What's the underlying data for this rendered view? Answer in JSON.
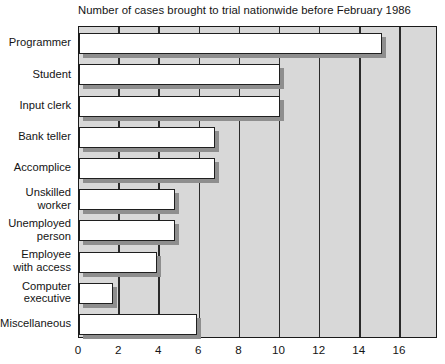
{
  "chart_data": {
    "type": "bar",
    "orientation": "horizontal",
    "title": "Number of cases brought to trial nationwide before February 1986",
    "xlabel": "",
    "ylabel": "",
    "xlim": [
      0,
      17.9
    ],
    "xticks": [
      0,
      2,
      4,
      6,
      8,
      10,
      12,
      14,
      16
    ],
    "xtick_labels": [
      "0",
      "2",
      "4",
      "6",
      "8",
      "10",
      "12",
      "14",
      "16"
    ],
    "grid": "vertical",
    "legend": "none",
    "categories": [
      "Programmer",
      "Student",
      "Input clerk",
      "Bank teller",
      "Accomplice",
      "Unskilled\nworker",
      "Unemployed\nperson",
      "Employee\nwith access",
      "Computer\nexecutive",
      "Miscellaneous"
    ],
    "values": [
      15.1,
      10.0,
      10.0,
      6.8,
      6.8,
      4.8,
      4.8,
      3.9,
      1.7,
      5.9
    ],
    "colors": {
      "bar_fill": "#ffffff",
      "bar_edge": "#1f1f1f",
      "bar_shadow": "#8e8e8e",
      "plot_background": "#d8d8d8",
      "gridline": "#2a2a2a",
      "text": "#141414",
      "page_background": "#ffffff"
    }
  }
}
